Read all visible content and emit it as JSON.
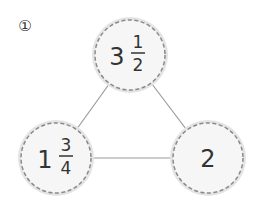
{
  "problem_number": "①",
  "colors": {
    "line": "#9a9a9a",
    "circle_fill": "#f5f5f5",
    "circle_outer": "#e2e2e2",
    "dash": "#8a8a8a",
    "text": "#333333"
  },
  "nodes": [
    {
      "id": "top",
      "whole": "3",
      "numerator": "1",
      "denominator": "2",
      "cx": 130,
      "cy": 55
    },
    {
      "id": "bottom-left",
      "whole": "1",
      "numerator": "3",
      "denominator": "4",
      "cx": 56,
      "cy": 158
    },
    {
      "id": "bottom-right",
      "whole": "2",
      "numerator": "",
      "denominator": "",
      "cx": 208,
      "cy": 158
    }
  ],
  "edges": [
    [
      "top",
      "bottom-left"
    ],
    [
      "top",
      "bottom-right"
    ],
    [
      "bottom-left",
      "bottom-right"
    ]
  ]
}
